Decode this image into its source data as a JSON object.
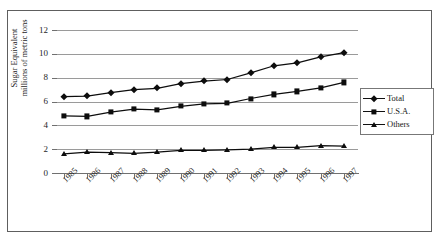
{
  "figure": {
    "title_remnant": "",
    "frame": {
      "border_color": "#5e5e5e"
    }
  },
  "legend": {
    "position": "right-middle",
    "entries": [
      {
        "label": "Total",
        "marker": "diamond-marker-icon"
      },
      {
        "label": "U.S.A.",
        "marker": "square-marker-icon"
      },
      {
        "label": "Others",
        "marker": "triangle-marker-icon"
      }
    ]
  },
  "axis": {
    "y_title_line1": "Sugar Equivalent",
    "y_title_line2": "millions of metric tons",
    "y_ticks": [
      "0",
      "2",
      "4",
      "6",
      "8",
      "10",
      "12"
    ],
    "x_ticks": [
      "1985",
      "1986",
      "1987",
      "1988",
      "1989",
      "1990",
      "1991",
      "1992",
      "1993",
      "1994",
      "1995",
      "1996",
      "1997"
    ]
  },
  "chart_data": {
    "type": "line",
    "title": "",
    "xlabel": "",
    "ylabel": "Sugar Equivalent millions of metric tons",
    "x": [
      1985,
      1986,
      1987,
      1988,
      1989,
      1990,
      1991,
      1992,
      1993,
      1994,
      1995,
      1996,
      1997
    ],
    "categories": [
      "1985",
      "1986",
      "1987",
      "1988",
      "1989",
      "1990",
      "1991",
      "1992",
      "1993",
      "1994",
      "1995",
      "1996",
      "1997"
    ],
    "series": [
      {
        "name": "Total",
        "marker": "diamond",
        "color": "#0d0d0d",
        "values": [
          6.4,
          6.45,
          6.75,
          7.0,
          7.1,
          7.5,
          7.7,
          7.85,
          8.4,
          9.0,
          9.25,
          9.75,
          10.1
        ]
      },
      {
        "name": "U.S.A.",
        "marker": "square",
        "color": "#0d0d0d",
        "values": [
          4.8,
          4.75,
          5.1,
          5.35,
          5.3,
          5.6,
          5.8,
          5.85,
          6.25,
          6.6,
          6.85,
          7.15,
          7.6
        ]
      },
      {
        "name": "Others",
        "marker": "triangle",
        "color": "#0d0d0d",
        "values": [
          1.6,
          1.75,
          1.7,
          1.65,
          1.75,
          1.9,
          1.9,
          1.95,
          2.0,
          2.15,
          2.15,
          2.3,
          2.25
        ]
      }
    ],
    "ylim": [
      0,
      12
    ],
    "ytick_step": 2,
    "grid": true,
    "grid_axis": "y",
    "legend_position": "right"
  }
}
